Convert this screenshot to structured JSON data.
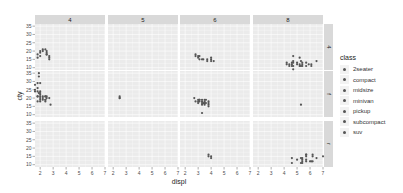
{
  "chart_data": {
    "type": "scatter",
    "title": "",
    "xlabel": "displ",
    "ylabel": "cty",
    "facet_cols": {
      "variable": "cyl",
      "labels": [
        "4",
        "5",
        "6",
        "8"
      ]
    },
    "facet_rows": {
      "variable": "drv",
      "labels": [
        "4",
        "f",
        "r"
      ]
    },
    "xlim": [
      1.6,
      7.0
    ],
    "ylim": [
      8.6,
      36.3
    ],
    "x_ticks": [
      2,
      3,
      4,
      5,
      6,
      7
    ],
    "y_ticks": [
      10,
      15,
      20,
      25,
      30,
      35
    ],
    "grid": true,
    "legend": {
      "title": "class",
      "position": "right",
      "entries": [
        "2seater",
        "compact",
        "midsize",
        "minivan",
        "pickup",
        "subcompact",
        "suv"
      ]
    },
    "panels": [
      {
        "row": "4",
        "col": "4",
        "points": [
          [
            1.8,
            18
          ],
          [
            1.8,
            16
          ],
          [
            2.0,
            20
          ],
          [
            2.0,
            19
          ],
          [
            2.2,
            21
          ],
          [
            2.2,
            20
          ],
          [
            2.4,
            21
          ],
          [
            2.5,
            20
          ],
          [
            2.5,
            18
          ],
          [
            2.5,
            18
          ],
          [
            2.7,
            17
          ],
          [
            2.7,
            16
          ],
          [
            2.5,
            19
          ],
          [
            2.7,
            15
          ],
          [
            2.0,
            17
          ]
        ]
      },
      {
        "row": "4",
        "col": "5",
        "points": []
      },
      {
        "row": "4",
        "col": "6",
        "points": [
          [
            2.8,
            17
          ],
          [
            2.8,
            18
          ],
          [
            3.1,
            17
          ],
          [
            3.1,
            15
          ],
          [
            3.4,
            15
          ],
          [
            3.7,
            15
          ],
          [
            4.0,
            14
          ],
          [
            4.0,
            16
          ],
          [
            3.7,
            14
          ],
          [
            3.0,
            17
          ],
          [
            3.3,
            15
          ],
          [
            4.0,
            15
          ],
          [
            4.2,
            14
          ],
          [
            3.0,
            16
          ]
        ]
      },
      {
        "row": "4",
        "col": "8",
        "points": [
          [
            4.2,
            12
          ],
          [
            4.4,
            11
          ],
          [
            4.6,
            13
          ],
          [
            4.6,
            12
          ],
          [
            4.7,
            13
          ],
          [
            4.7,
            9
          ],
          [
            4.7,
            11
          ],
          [
            5.2,
            11
          ],
          [
            5.2,
            12
          ],
          [
            5.3,
            14
          ],
          [
            5.4,
            11
          ],
          [
            5.4,
            13
          ],
          [
            5.7,
            11
          ],
          [
            4.7,
            17
          ],
          [
            4.2,
            13
          ],
          [
            5.9,
            12
          ],
          [
            6.1,
            11
          ],
          [
            6.5,
            14
          ],
          [
            4.6,
            11
          ],
          [
            5.4,
            12
          ],
          [
            5.3,
            11
          ],
          [
            4.4,
            12
          ],
          [
            5.0,
            13
          ],
          [
            5.7,
            13
          ],
          [
            4.7,
            14
          ],
          [
            5.2,
            16
          ],
          [
            5.0,
            12
          ],
          [
            6.1,
            12
          ]
        ]
      },
      {
        "row": "f",
        "col": "4",
        "points": [
          [
            1.8,
            18
          ],
          [
            1.8,
            21
          ],
          [
            2.0,
            20
          ],
          [
            2.0,
            21
          ],
          [
            2.8,
            16
          ],
          [
            2.4,
            19
          ],
          [
            2.4,
            21
          ],
          [
            2.0,
            22
          ],
          [
            2.0,
            24
          ],
          [
            2.0,
            19
          ],
          [
            2.2,
            21
          ],
          [
            1.6,
            28
          ],
          [
            1.6,
            24
          ],
          [
            1.8,
            26
          ],
          [
            1.9,
            33
          ],
          [
            2.4,
            21
          ],
          [
            2.5,
            20
          ],
          [
            1.8,
            24
          ],
          [
            2.0,
            23
          ],
          [
            2.2,
            19
          ],
          [
            2.4,
            18
          ],
          [
            2.0,
            29
          ],
          [
            1.8,
            29
          ],
          [
            1.9,
            35
          ],
          [
            2.5,
            21
          ],
          [
            2.7,
            20
          ],
          [
            2.4,
            19
          ],
          [
            1.6,
            25
          ],
          [
            1.9,
            23
          ],
          [
            2.2,
            20
          ],
          [
            2.0,
            18
          ],
          [
            1.8,
            21
          ]
        ]
      },
      {
        "row": "f",
        "col": "5",
        "points": [
          [
            2.5,
            20
          ],
          [
            2.5,
            21
          ],
          [
            2.5,
            20
          ]
        ]
      },
      {
        "row": "f",
        "col": "6",
        "points": [
          [
            2.8,
            18
          ],
          [
            3.1,
            18
          ],
          [
            3.3,
            18
          ],
          [
            3.3,
            17
          ],
          [
            3.5,
            18
          ],
          [
            3.8,
            18
          ],
          [
            3.8,
            16
          ],
          [
            3.5,
            19
          ],
          [
            3.0,
            18
          ],
          [
            3.0,
            19
          ],
          [
            3.4,
            17
          ],
          [
            3.6,
            17
          ],
          [
            3.3,
            16
          ],
          [
            3.8,
            17
          ],
          [
            3.5,
            17
          ],
          [
            3.1,
            19
          ],
          [
            3.3,
            19
          ],
          [
            3.8,
            15
          ],
          [
            3.0,
            17
          ],
          [
            3.3,
            11
          ],
          [
            3.5,
            16
          ],
          [
            3.6,
            19
          ],
          [
            2.7,
            20
          ],
          [
            3.1,
            19
          ]
        ]
      },
      {
        "row": "f",
        "col": "8",
        "points": [
          [
            5.3,
            16
          ]
        ]
      },
      {
        "row": "r",
        "col": "4",
        "points": []
      },
      {
        "row": "r",
        "col": "5",
        "points": []
      },
      {
        "row": "r",
        "col": "6",
        "points": [
          [
            3.8,
            16
          ],
          [
            4.0,
            15
          ],
          [
            4.0,
            14
          ],
          [
            3.8,
            15
          ]
        ]
      },
      {
        "row": "r",
        "col": "8",
        "points": [
          [
            5.7,
            16
          ],
          [
            5.7,
            15
          ],
          [
            6.2,
            16
          ],
          [
            6.2,
            15
          ],
          [
            7.0,
            15
          ],
          [
            5.3,
            14
          ],
          [
            5.3,
            11
          ],
          [
            5.7,
            13
          ],
          [
            6.0,
            12
          ],
          [
            5.4,
            12
          ],
          [
            5.4,
            11
          ],
          [
            4.6,
            14
          ],
          [
            4.6,
            11
          ],
          [
            5.0,
            13
          ],
          [
            5.4,
            13
          ],
          [
            5.7,
            12
          ],
          [
            6.2,
            12
          ],
          [
            5.4,
            14
          ],
          [
            5.7,
            16
          ],
          [
            6.5,
            14
          ],
          [
            6.1,
            12
          ]
        ]
      }
    ]
  },
  "legend": {
    "title": "class",
    "items": [
      "2seater",
      "compact",
      "midsize",
      "minivan",
      "pickup",
      "subcompact",
      "suv"
    ]
  },
  "colors": {
    "panel_bg": "#ebebeb",
    "grid_major": "#ffffff",
    "strip_bg": "#d9d9d9",
    "point": "#555555",
    "text": "#4d4d4d"
  }
}
